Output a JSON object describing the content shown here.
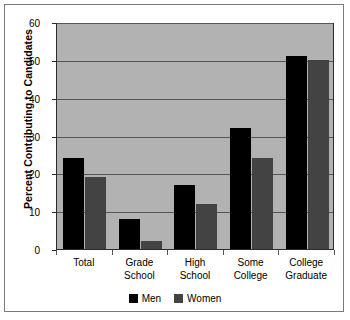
{
  "chart_data": {
    "type": "bar",
    "title": "",
    "subtitle": "",
    "xlabel": "",
    "ylabel": "Percent Contributing to Candidates",
    "ylim": [
      0,
      60
    ],
    "yticks": [
      0,
      10,
      20,
      30,
      40,
      50,
      60
    ],
    "ytick_labels": [
      "0",
      "10",
      "20",
      "30",
      "40",
      "50",
      "60"
    ],
    "grid": true,
    "legend_position": "bottom-center",
    "categories": [
      "Total",
      "Grade School",
      "High School",
      "Some College",
      "College Graduate"
    ],
    "category_lines": [
      [
        "Total"
      ],
      [
        "Grade",
        "School"
      ],
      [
        "High",
        "School"
      ],
      [
        "Some",
        "College"
      ],
      [
        "College",
        "Graduate"
      ]
    ],
    "series": [
      {
        "name": "Men",
        "color": "#000000",
        "values": [
          24,
          8,
          17,
          32,
          51
        ]
      },
      {
        "name": "Women",
        "color": "#434343",
        "values": [
          19,
          2,
          12,
          24,
          50
        ]
      }
    ]
  },
  "legend": {
    "entries": [
      {
        "label": "Men",
        "swatch": "men-swatch"
      },
      {
        "label": "Women",
        "swatch": "women-swatch"
      }
    ]
  },
  "colors": {
    "plot_background": "#b2b2b2",
    "men_bar": "#000000",
    "women_bar": "#434343",
    "gridline": "#555555",
    "axis": "#2b2b2b",
    "frame_border": "#7a7a7a",
    "page_background": "#ffffff"
  }
}
